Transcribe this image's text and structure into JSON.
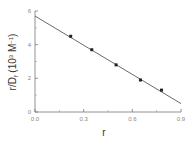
{
  "chart_data": {
    "type": "scatter",
    "title": "",
    "xlabel": "r",
    "ylabel": "r/D_f (10^3 M^-1)",
    "xlim": [
      0.0,
      0.9
    ],
    "ylim": [
      0,
      6
    ],
    "xticks": [
      0.0,
      0.3,
      0.6,
      0.9
    ],
    "xtick_labels": [
      "0.0",
      "0.3",
      "0.6",
      "0.9"
    ],
    "yticks": [
      0,
      2,
      4,
      6
    ],
    "ytick_labels": [
      "0",
      "2",
      "4",
      "6"
    ],
    "grid": false,
    "legend": null,
    "series": [
      {
        "name": "data",
        "marker": "square",
        "x": [
          0.22,
          0.35,
          0.5,
          0.65,
          0.78
        ],
        "y": [
          4.5,
          3.7,
          2.8,
          1.9,
          1.3
        ]
      },
      {
        "name": "linear fit",
        "style": "line",
        "x": [
          0.0,
          0.9
        ],
        "y": [
          5.7,
          0.5
        ]
      }
    ]
  },
  "labels": {
    "xlabel": "r",
    "ylabel_main": "r/D",
    "ylabel_sub": "f",
    "ylabel_units": " (10",
    "ylabel_exp": "3",
    "ylabel_unit2": " M",
    "ylabel_exp2": "−1",
    "ylabel_close": ")"
  }
}
